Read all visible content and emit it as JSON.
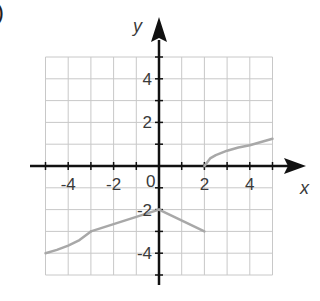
{
  "part_label": ")",
  "chart_data": {
    "type": "line",
    "title": "",
    "xlabel": "x",
    "ylabel": "y",
    "xlim": [
      -5,
      5
    ],
    "ylim": [
      -5,
      5
    ],
    "grid": true,
    "x_ticks": [
      -4,
      -2,
      0,
      2,
      4
    ],
    "y_ticks": [
      4,
      2,
      -2,
      -4
    ],
    "x_tick_labels": [
      "-4",
      "-2",
      "0",
      "2",
      "4"
    ],
    "y_tick_labels": [
      "4",
      "2",
      "-2",
      "-4"
    ],
    "origin_label": "0",
    "series": [
      {
        "name": "segment-1 (curve)",
        "points": [
          [
            -5,
            -4
          ],
          [
            -4.5,
            -3.85
          ],
          [
            -4,
            -3.65
          ],
          [
            -3.5,
            -3.4
          ],
          [
            -3,
            -3
          ]
        ]
      },
      {
        "name": "segment-2 (line)",
        "points": [
          [
            -3,
            -3
          ],
          [
            0,
            -2
          ]
        ]
      },
      {
        "name": "segment-3 (line)",
        "points": [
          [
            0,
            -2
          ],
          [
            2,
            -3
          ]
        ]
      },
      {
        "name": "segment-4 (sqrt curve)",
        "points": [
          [
            2,
            0
          ],
          [
            2.25,
            0.35
          ],
          [
            2.5,
            0.5
          ],
          [
            3,
            0.7
          ],
          [
            3.5,
            0.85
          ],
          [
            4,
            0.95
          ],
          [
            4.5,
            1.1
          ],
          [
            5,
            1.25
          ]
        ]
      }
    ],
    "colors": {
      "curve": "#a8a8a8",
      "grid": "#c8c8c8",
      "axis": "#111111"
    }
  }
}
